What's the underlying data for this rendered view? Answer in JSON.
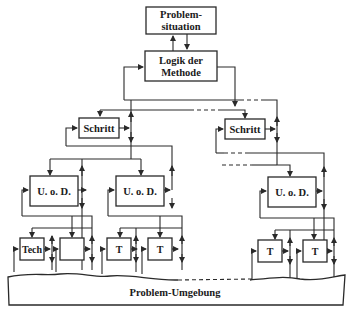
{
  "diagram": {
    "nodes": {
      "problem_situation": {
        "line1": "Problem-",
        "line2": "situation"
      },
      "logik": {
        "line1": "Logik der",
        "line2": "Methode"
      },
      "schritt_left": {
        "label": "Schritt"
      },
      "schritt_right": {
        "label": "Schritt"
      },
      "uod_1": {
        "label": "U. o. D."
      },
      "uod_2": {
        "label": "U. o. D."
      },
      "uod_3": {
        "label": "U. o. D."
      },
      "leaf_1": {
        "label": "Tech"
      },
      "leaf_2": {
        "label": ""
      },
      "leaf_3": {
        "label": "T"
      },
      "leaf_4": {
        "label": "T"
      },
      "leaf_5": {
        "label": "T"
      },
      "leaf_6": {
        "label": "T"
      }
    },
    "environment": {
      "label": "Problem-Umgebung"
    }
  }
}
